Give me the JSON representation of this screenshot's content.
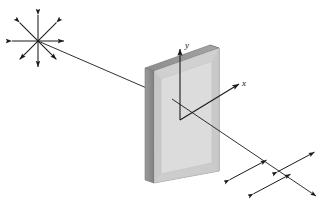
{
  "figure": {
    "background_color": "#ffffff",
    "width": 327,
    "height": 212
  },
  "labels": {
    "y_axis": "y",
    "x_axis": "x"
  },
  "colors": {
    "line": "#1a1a1a",
    "plate_front": "#d9d9d9",
    "plate_front_inner": "#cfcfcf",
    "plate_top": "#9a9a9a",
    "plate_side": "#8f8f8f",
    "plate_border": "#7a7a7a",
    "plate_bezel": "#c2c2c2"
  },
  "geometry": {
    "plate": {
      "front_face": [
        [
          145,
          68
        ],
        [
          210,
          45
        ],
        [
          210,
          168
        ],
        [
          145,
          180
        ]
      ],
      "top_face": [
        [
          145,
          68
        ],
        [
          210,
          45
        ],
        [
          219,
          48
        ],
        [
          154,
          71
        ]
      ],
      "left_face": [
        [
          145,
          68
        ],
        [
          154,
          71
        ],
        [
          154,
          183
        ],
        [
          145,
          180
        ]
      ],
      "back_right_edge": [
        [
          210,
          45
        ],
        [
          219,
          48
        ],
        [
          219,
          171
        ],
        [
          210,
          168
        ]
      ],
      "inner_window": [
        [
          152,
          76
        ],
        [
          204,
          57
        ],
        [
          204,
          160
        ],
        [
          152,
          172
        ]
      ]
    },
    "axes": {
      "origin": [
        180,
        120
      ],
      "y_tip": [
        180,
        49
      ],
      "x_tip": [
        239,
        84
      ]
    },
    "beam": {
      "unpolarized_source": [
        38,
        41
      ],
      "entry_point": [
        165,
        95
      ],
      "exit_point": [
        206,
        117
      ],
      "end_point": [
        316,
        196
      ]
    },
    "starburst": {
      "center": [
        38,
        41
      ],
      "ray_count": 8,
      "ray_length": 26,
      "angles_deg": [
        0,
        45,
        90,
        135,
        180,
        225,
        270,
        315
      ]
    },
    "polarized_arrows": {
      "count": 3,
      "arrow_length": 42,
      "angle_deg": -28,
      "centers": [
        [
          248,
          170
        ],
        [
          272,
          184
        ],
        [
          296,
          162
        ]
      ]
    }
  },
  "elements": {
    "unpolarized_light": "unpolarized-light-starburst",
    "incident_beam": "incident-light-beam",
    "polarizer": "polarizer-plate",
    "transmitted_beam": "transmitted-light-beam",
    "polarized_oscillation": "linearly-polarized-field-arrows"
  }
}
